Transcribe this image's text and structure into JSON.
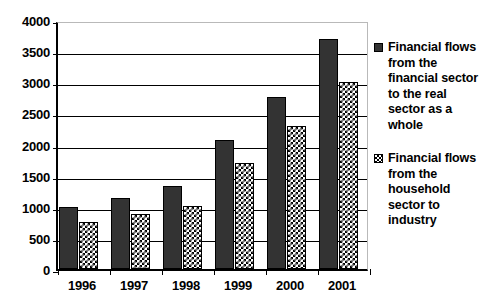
{
  "chart_data": {
    "type": "bar",
    "title": "",
    "subtitle": "",
    "xlabel": "",
    "ylabel": "",
    "categories": [
      "1996",
      "1997",
      "1998",
      "1999",
      "2000",
      "2001"
    ],
    "series": [
      {
        "name": "Financial flows from the financial sector to the real sector as a whole",
        "key": "solid",
        "color": "#333333",
        "fill": "solid",
        "values": [
          1000,
          1140,
          1330,
          2070,
          2760,
          3690
        ]
      },
      {
        "name": "Financial flows from the household sector to industry",
        "key": "checker",
        "color": "#000000",
        "fill": "checkerboard",
        "values": [
          750,
          880,
          1020,
          1710,
          2290,
          3000
        ]
      }
    ],
    "ylim": [
      0,
      4000
    ],
    "yticks": [
      0,
      500,
      1000,
      1500,
      2000,
      2500,
      3000,
      3500,
      4000
    ],
    "ytick_labels": [
      "0",
      "500",
      "1000",
      "1500",
      "2000",
      "2500",
      "3000",
      "3500",
      "4000"
    ],
    "grid": true,
    "grid_axis": "y",
    "legend_position": "right",
    "annotations": []
  },
  "legend": {
    "entries": [
      {
        "swatch": "solid-dark-square-swatch",
        "label": "Financial flows from the financial sector to the real sector as a whole"
      },
      {
        "swatch": "checkerboard-square-swatch",
        "label": "Financial flows from the household sector to industry"
      }
    ]
  }
}
